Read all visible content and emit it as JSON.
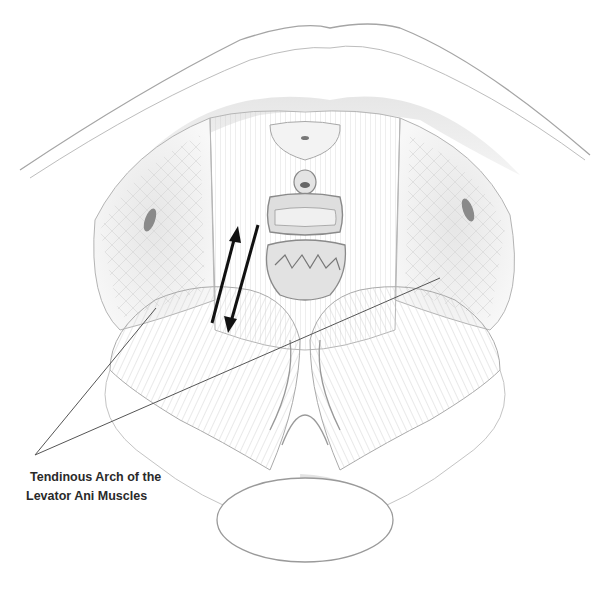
{
  "figure": {
    "label": {
      "line1": "Tendinous Arch of the",
      "line2": "Levator Ani Muscles"
    },
    "pointer_lines": [
      {
        "from": [
          35,
          455
        ],
        "to": [
          156,
          308
        ]
      },
      {
        "from": [
          35,
          455
        ],
        "to": [
          440,
          278
        ]
      }
    ],
    "arrows": [
      {
        "direction": "up",
        "from": [
          212,
          323
        ],
        "to": [
          238,
          228
        ]
      },
      {
        "direction": "down",
        "from": [
          258,
          225
        ],
        "to": [
          228,
          332
        ]
      }
    ],
    "colors": {
      "ink": "#1a1a1a",
      "pencil": "#9a9a9a",
      "shade": "#cfcfcf",
      "paper": "#ffffff"
    }
  }
}
